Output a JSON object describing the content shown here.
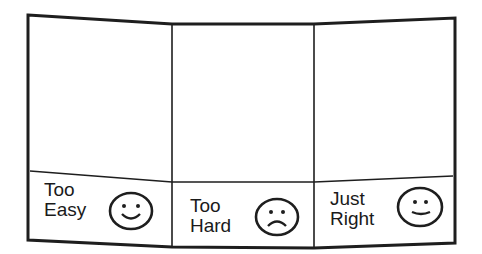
{
  "card": {
    "panels": [
      {
        "label_line1": "Too",
        "label_line2": "Easy",
        "face": "smiley-face"
      },
      {
        "label_line1": "Too",
        "label_line2": "Hard",
        "face": "frowny-face"
      },
      {
        "label_line1": "Just",
        "label_line2": "Right",
        "face": "smiley-face"
      }
    ],
    "stroke_color": "#1e1e1e",
    "background": "#ffffff"
  }
}
